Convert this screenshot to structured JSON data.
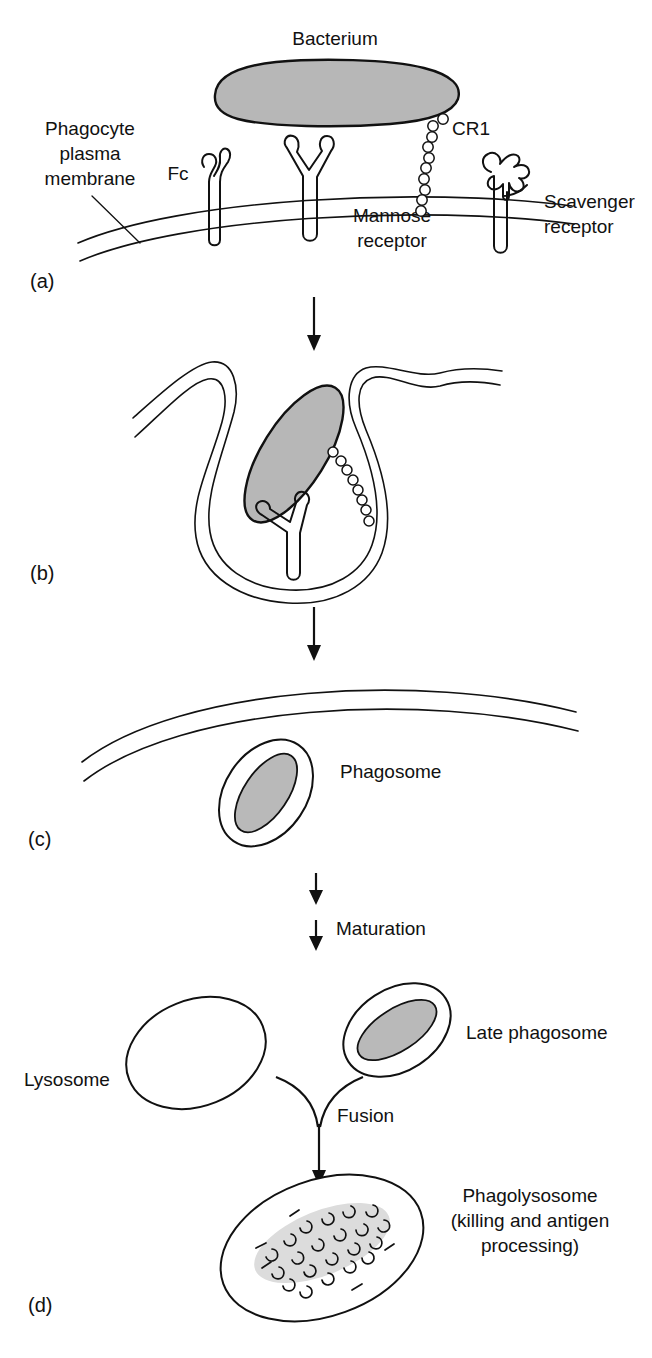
{
  "figure": {
    "colors": {
      "ink": "#111111",
      "bacterium_fill": "#b7b7b7",
      "debris_fill": "#dcdcdc",
      "background": "#ffffff"
    }
  },
  "panels": [
    {
      "id": "a",
      "label": "(a)"
    },
    {
      "id": "b",
      "label": "(b)"
    },
    {
      "id": "c",
      "label": "(c)"
    },
    {
      "id": "d",
      "label": "(d)"
    }
  ],
  "panel_a": {
    "bacterium_label": "Bacterium",
    "membrane_label_lines": [
      "Phagocyte",
      "plasma",
      "membrane"
    ],
    "fc_label": "Fc",
    "cr1_label": "CR1",
    "mannose_label_lines": [
      "Mannose",
      "receptor"
    ],
    "scavenger_label_lines": [
      "Scavenger",
      "receptor"
    ]
  },
  "panel_c": {
    "phagosome_label": "Phagosome"
  },
  "panel_d": {
    "maturation_label": "Maturation",
    "lysosome_label": "Lysosome",
    "late_phagosome_label": "Late phagosome",
    "fusion_label": "Fusion",
    "phagolysosome_label_lines": [
      "Phagolysosome",
      "(killing and antigen",
      "processing)"
    ]
  }
}
